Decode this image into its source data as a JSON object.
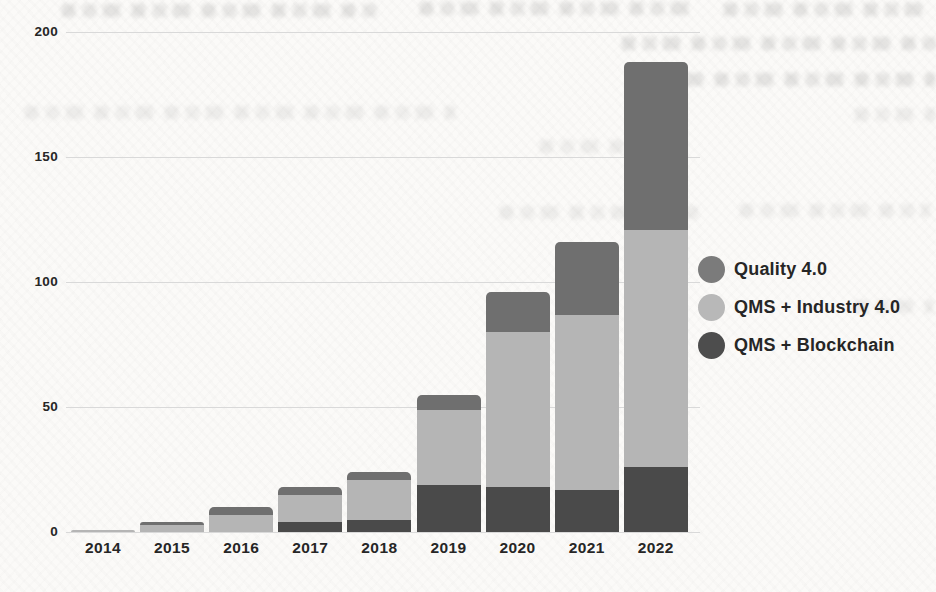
{
  "chart_data": {
    "type": "bar",
    "stacked": true,
    "title": "",
    "xlabel": "",
    "ylabel": "",
    "categories": [
      "2014",
      "2015",
      "2016",
      "2017",
      "2018",
      "2019",
      "2020",
      "2021",
      "2022"
    ],
    "series": [
      {
        "name": "QMS + Blockchain",
        "color": "#4a4a4a",
        "values": [
          0,
          0,
          0,
          4,
          5,
          19,
          18,
          17,
          26
        ]
      },
      {
        "name": "QMS + Industry 4.0",
        "color": "#b5b5b5",
        "values": [
          1,
          3,
          7,
          11,
          16,
          30,
          62,
          70,
          95
        ]
      },
      {
        "name": "Quality 4.0",
        "color": "#6f6f6f",
        "values": [
          0,
          1,
          3,
          3,
          3,
          6,
          16,
          29,
          67
        ]
      }
    ],
    "totals": [
      1,
      4,
      10,
      18,
      24,
      55,
      96,
      116,
      188
    ],
    "ylim": [
      0,
      200
    ],
    "yticks": [
      0,
      50,
      100,
      150,
      200
    ],
    "grid": true,
    "legend_position": "right",
    "legend": [
      {
        "label": "Quality 4.0",
        "color": "#7b7b7b"
      },
      {
        "label": "QMS + Industry 4.0",
        "color": "#b8b8b8"
      },
      {
        "label": "QMS + Blockchain",
        "color": "#4d4d4d"
      }
    ]
  }
}
